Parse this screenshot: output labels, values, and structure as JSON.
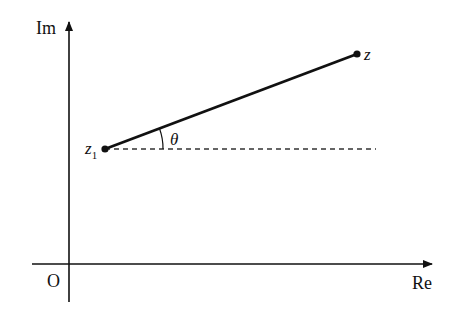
{
  "diagram": {
    "type": "complex-plane",
    "axes": {
      "x_label": "Re",
      "y_label": "Im",
      "origin_label": "O"
    },
    "points": {
      "z1": {
        "label": "z",
        "subscript": "1"
      },
      "z": {
        "label": "z"
      }
    },
    "angle_label": "θ",
    "colors": {
      "stroke": "#111111",
      "background": "#ffffff"
    }
  }
}
